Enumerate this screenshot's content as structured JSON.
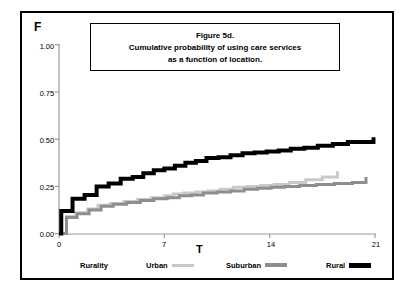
{
  "figure": {
    "title_lines": [
      "Figure 5d.",
      "Cumulative probability of using care services",
      "as a function of location."
    ],
    "y_axis_label": "F",
    "x_axis_label": "T",
    "legend_title": "Rurality"
  },
  "colors": {
    "urban": "#c9c9c9",
    "suburban": "#8e8e8e",
    "rural": "#000000",
    "axis": "#9a9a9a",
    "frame": "#000000"
  },
  "chart_data": {
    "type": "line",
    "title": "Figure 5d. Cumulative probability of using care services as a function of location.",
    "xlabel": "T",
    "ylabel": "F",
    "xlim": [
      0,
      21
    ],
    "ylim": [
      0,
      1.0
    ],
    "xticks": [
      0,
      7,
      14,
      21
    ],
    "xtick_labels": [
      "0",
      "7",
      "14",
      "21"
    ],
    "yticks": [
      0.0,
      0.25,
      0.5,
      0.75,
      1.0
    ],
    "ytick_labels": [
      "0.00",
      "0.25",
      "0.50",
      "0.75",
      "1.00"
    ],
    "grid": false,
    "legend_position": "bottom",
    "step_type": "post",
    "series": [
      {
        "name": "Urban",
        "color": "#c9c9c9",
        "linewidth": 3,
        "x": [
          0,
          0.5,
          1.1,
          1.9,
          2.6,
          3.4,
          4.3,
          5.2,
          6.1,
          7.0,
          7.6,
          8.3,
          9.1,
          9.9,
          10.7,
          11.6,
          12.5,
          13.4,
          14.3,
          15.3,
          16.4,
          17.5,
          18.5,
          18.5
        ],
        "y": [
          0.0,
          0.09,
          0.11,
          0.13,
          0.15,
          0.16,
          0.17,
          0.18,
          0.19,
          0.2,
          0.21,
          0.215,
          0.22,
          0.225,
          0.235,
          0.245,
          0.25,
          0.255,
          0.26,
          0.27,
          0.285,
          0.3,
          0.3,
          0.33
        ]
      },
      {
        "name": "Suburban",
        "color": "#8e8e8e",
        "linewidth": 3,
        "x": [
          0,
          0.5,
          1.2,
          2.0,
          2.8,
          3.6,
          4.5,
          5.4,
          6.3,
          7.2,
          8.0,
          8.8,
          9.6,
          10.5,
          11.4,
          12.3,
          13.2,
          14.1,
          15.0,
          16.0,
          17.1,
          18.3,
          19.5,
          20.4,
          20.4
        ],
        "y": [
          0.0,
          0.085,
          0.105,
          0.125,
          0.145,
          0.155,
          0.165,
          0.175,
          0.185,
          0.19,
          0.2,
          0.205,
          0.215,
          0.22,
          0.225,
          0.235,
          0.24,
          0.245,
          0.25,
          0.255,
          0.26,
          0.265,
          0.27,
          0.27,
          0.3
        ]
      },
      {
        "name": "Rural",
        "color": "#000000",
        "linewidth": 4,
        "x": [
          0,
          0.15,
          0.9,
          1.7,
          2.5,
          3.3,
          4.1,
          4.9,
          5.6,
          6.3,
          7.0,
          7.7,
          8.4,
          9.1,
          9.8,
          10.6,
          11.4,
          12.2,
          13.0,
          13.8,
          14.6,
          15.4,
          16.3,
          17.2,
          18.2,
          19.2,
          20.9,
          20.9
        ],
        "y": [
          0.0,
          0.12,
          0.185,
          0.205,
          0.25,
          0.265,
          0.29,
          0.3,
          0.32,
          0.335,
          0.345,
          0.36,
          0.375,
          0.385,
          0.4,
          0.405,
          0.415,
          0.425,
          0.43,
          0.435,
          0.44,
          0.45,
          0.455,
          0.465,
          0.475,
          0.485,
          0.49,
          0.51
        ]
      }
    ]
  }
}
